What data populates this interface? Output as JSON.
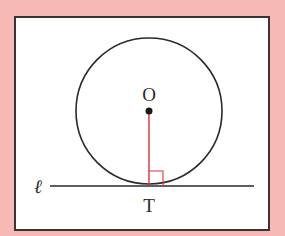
{
  "diagram": {
    "type": "tangent-line-to-circle",
    "labels": {
      "center": "O",
      "tangent_point": "T",
      "line": "ℓ"
    },
    "colors": {
      "background": "#F6B9B5",
      "panel": "#FFFFFF",
      "stroke": "#2a2a2a",
      "radius": "#E0303A",
      "right_angle": "#E0303A"
    },
    "elements": [
      {
        "kind": "circle",
        "name": "circle-O",
        "center": "O"
      },
      {
        "kind": "point",
        "name": "center-O"
      },
      {
        "kind": "segment",
        "name": "radius-OT",
        "from": "O",
        "to": "T",
        "color": "red"
      },
      {
        "kind": "line",
        "name": "tangent-line-l",
        "label": "ℓ"
      },
      {
        "kind": "right-angle-marker",
        "at": "T"
      }
    ]
  }
}
